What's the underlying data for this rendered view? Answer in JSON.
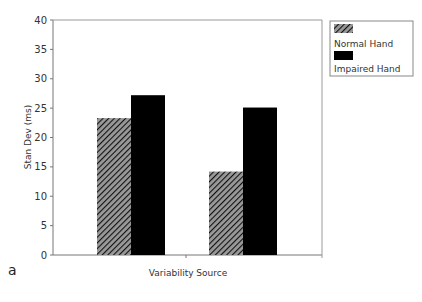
{
  "chart_data": {
    "type": "bar",
    "title": "",
    "panel_label": "a",
    "xlabel": "Variability Source",
    "ylabel": "Stan Dev (ms)",
    "ylim": [
      0,
      40
    ],
    "yticks": [
      0,
      5,
      10,
      15,
      20,
      25,
      30,
      35,
      40
    ],
    "categories": [
      "",
      ""
    ],
    "series": [
      {
        "name": "Normal Hand",
        "pattern": "hatched",
        "values": [
          23.3,
          14.2
        ]
      },
      {
        "name": "Impaired Hand",
        "pattern": "solid-black",
        "values": [
          27.2,
          25.1
        ]
      }
    ],
    "grid": false,
    "legend_position": "right-top"
  },
  "legend": {
    "items": [
      "Normal Hand",
      "Impaired Hand"
    ]
  },
  "panel_label": "a"
}
